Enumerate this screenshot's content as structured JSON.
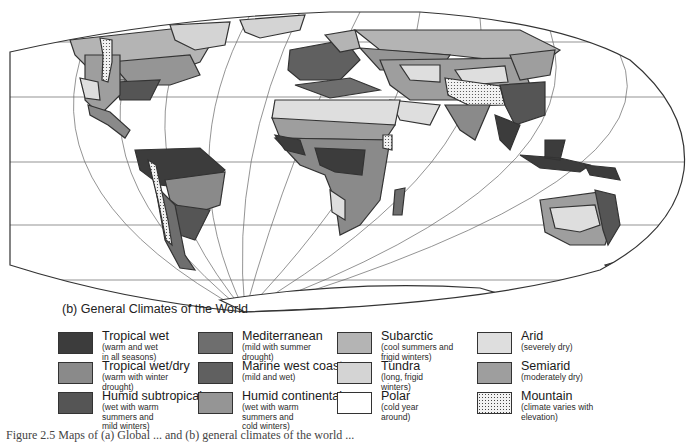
{
  "map": {
    "caption": "(b) General Climates of the World",
    "colors": {
      "tropical_wet": "#3c3c3c",
      "tropical_wet_dry": "#8a8a8a",
      "humid_subtropical": "#555555",
      "mediterranean": "#6e6e6e",
      "marine_west_coast": "#606060",
      "humid_continental": "#959595",
      "subarctic": "#b4b4b4",
      "tundra": "#d4d4d4",
      "polar": "#ffffff",
      "arid": "#dedede",
      "semiarid": "#9e9e9e",
      "mountain": "#f0f0f0",
      "outline": "#333333",
      "graticule": "#555555"
    }
  },
  "legend": {
    "columns": [
      {
        "items": [
          {
            "title": "Tropical wet",
            "desc": [
              "(warm and wet",
              " in all seasons)"
            ],
            "color": "#3c3c3c"
          },
          {
            "title": "Tropical wet/dry",
            "desc": [
              "(warm with winter",
              "  drought)"
            ],
            "color": "#8a8a8a"
          },
          {
            "title": "Humid subtropical",
            "desc": [
              "(wet with warm",
              " summers and",
              " mild winters)"
            ],
            "color": "#555555"
          }
        ]
      },
      {
        "items": [
          {
            "title": "Mediterranean",
            "desc": [
              "(mild with summer",
              "   drought)"
            ],
            "color": "#6e6e6e"
          },
          {
            "title": "Marine west coast",
            "desc": [
              "(mild and wet)"
            ],
            "color": "#606060"
          },
          {
            "title": "Humid continental",
            "desc": [
              "(wet with warm",
              " summers and",
              " cold winters)"
            ],
            "color": "#959595"
          }
        ]
      },
      {
        "items": [
          {
            "title": "Subarctic",
            "desc": [
              "(cool summers and",
              " frigid winters)"
            ],
            "color": "#b4b4b4"
          },
          {
            "title": "Tundra",
            "desc": [
              "(long, frigid",
              "  winters)"
            ],
            "color": "#d4d4d4"
          },
          {
            "title": "Polar",
            "desc": [
              "(cold year",
              "  around)"
            ],
            "color": "#ffffff"
          }
        ]
      },
      {
        "items": [
          {
            "title": "Arid",
            "desc": [
              "(severely dry)"
            ],
            "color": "#dedede"
          },
          {
            "title": "Semiarid",
            "desc": [
              "(moderately dry)"
            ],
            "color": "#9e9e9e"
          },
          {
            "title": "Mountain",
            "desc": [
              "(climate varies with",
              "  elevation)"
            ],
            "color": "dotted"
          }
        ]
      }
    ]
  },
  "footer": {
    "text": "Figure 2.5  Maps of (a) Global ... and (b) general climates of the world ..."
  }
}
